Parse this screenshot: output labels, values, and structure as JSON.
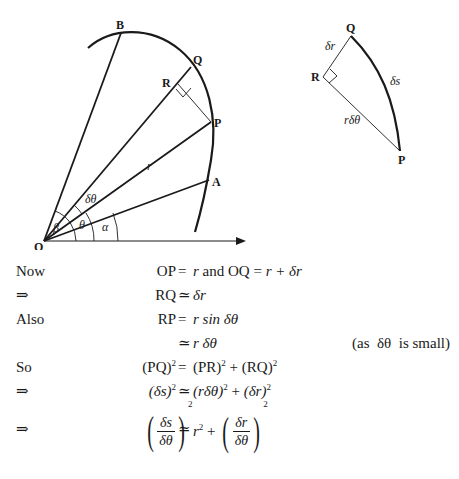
{
  "figure_main": {
    "points": {
      "O": "O",
      "A": "A",
      "P": "P",
      "Q": "Q",
      "R": "R",
      "B": "B"
    },
    "labels": {
      "r": "r",
      "delta_theta": "δθ",
      "theta": "θ",
      "alpha": "α",
      "beta": "β"
    }
  },
  "figure_inset": {
    "points": {
      "Q": "Q",
      "R": "R",
      "P": "P"
    },
    "labels": {
      "delta_r": "δr",
      "delta_s": "δs",
      "r_delta_theta": "rδθ"
    }
  },
  "derivation": [
    {
      "word": "Now",
      "lhs": "OP",
      "rel": "=",
      "rhs_parts": [
        "r",
        " and ",
        "OQ",
        " = ",
        "r + δr"
      ]
    },
    {
      "word": "⇒",
      "lhs": "RQ",
      "rel": "≃",
      "rhs": "δr"
    },
    {
      "word": "Also",
      "lhs": "RP",
      "rel": "=",
      "rhs": "r sin δθ"
    },
    {
      "word": "",
      "lhs": "",
      "rel": "≃",
      "rhs": "r δθ",
      "note": "(as  δθ  is small)"
    },
    {
      "word": "So",
      "lhs": "(PQ)",
      "lhs_sup": "2",
      "rel": "=",
      "rhs_a": "(PR)",
      "rhs_a_sup": "2",
      "rhs_plus": " + ",
      "rhs_b": "(RQ)",
      "rhs_b_sup": "2"
    },
    {
      "word": "⇒",
      "lhs": "(δs)",
      "lhs_sup": "2",
      "rel": "≃",
      "rhs_a": "(rδθ)",
      "rhs_a_sup": "2",
      "rhs_plus": " + ",
      "rhs_b": "(δr)",
      "rhs_b_sup": "2"
    },
    {
      "word": "⇒",
      "lhs_num": "δs",
      "lhs_den": "δθ",
      "lhs_sup": "2",
      "rel": "≃",
      "rhs_a": "r",
      "rhs_a_sup": "2",
      "rhs_plus": " + ",
      "rhs_num": "δr",
      "rhs_den": "δθ",
      "rhs_sup": "2"
    }
  ]
}
